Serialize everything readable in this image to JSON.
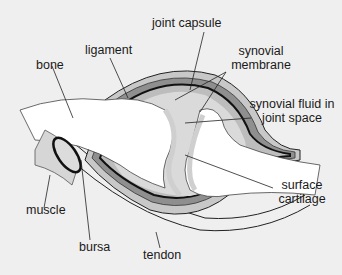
{
  "diagram": {
    "labels": {
      "bone": "bone",
      "ligament": "ligament",
      "joint_capsule": "joint capsule",
      "synovial_membrane_1": "synovial",
      "synovial_membrane_2": "membrane",
      "synovial_fluid_1": "synovial fluid in",
      "synovial_fluid_2": "joint space",
      "surface_cartilage_1": "surface",
      "surface_cartilage_2": "cartilage",
      "muscle": "muscle",
      "bursa": "bursa",
      "tendon": "tendon"
    },
    "colors": {
      "background": "#efefef",
      "bone": "#ffffff",
      "capsule_dark": "#8c8c8c",
      "capsule_light": "#c4c4c4",
      "fluid": "#d9d9d9",
      "outline": "#111111"
    }
  }
}
